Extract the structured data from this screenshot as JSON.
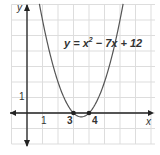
{
  "chart_data": {
    "type": "line",
    "title": "",
    "equation": "y = x² − 7x + 12",
    "xlabel": "x",
    "ylabel": "y",
    "xlim": [
      -1,
      8
    ],
    "ylim": [
      -2,
      7
    ],
    "grid": true,
    "x_tick_labels": [
      {
        "value": 1,
        "label": "1"
      },
      {
        "value": 3,
        "label": "3"
      },
      {
        "value": 4,
        "label": "4"
      }
    ],
    "y_tick_labels": [
      {
        "value": 1,
        "label": "1"
      }
    ],
    "highlighted_points": [
      {
        "x": 3,
        "y": 0
      },
      {
        "x": 4,
        "y": 0
      }
    ],
    "series": [
      {
        "name": "y = x^2 - 7x + 12",
        "function": "x^2 - 7x + 12",
        "x": [
          0.8,
          1,
          1.5,
          2,
          2.5,
          3,
          3.5,
          4,
          4.5,
          5,
          5.5,
          6,
          6.2
        ],
        "values": [
          7.04,
          6,
          3.75,
          2,
          0.75,
          0,
          -0.25,
          0,
          0.75,
          2,
          3.75,
          6,
          7.04
        ]
      }
    ]
  },
  "labels": {
    "x_axis": "x",
    "y_axis": "y",
    "tick_1": "1",
    "tick_3": "3",
    "tick_4": "4",
    "ytick_1": "1",
    "equation_prefix": "y = x",
    "equation_exp": "2",
    "equation_suffix": " − 7x + 12"
  }
}
